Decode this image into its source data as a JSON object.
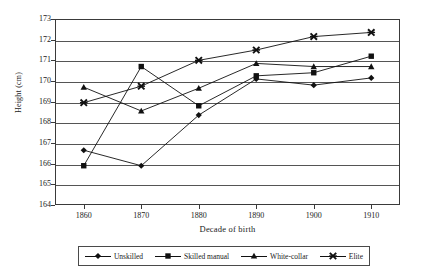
{
  "chart_data": {
    "type": "line",
    "title": "",
    "xlabel": "Decade of birth",
    "ylabel": "Height (cm)",
    "categories": [
      "1860",
      "1870",
      "1880",
      "1890",
      "1900",
      "1910"
    ],
    "x": [
      1860,
      1870,
      1880,
      1890,
      1900,
      1910
    ],
    "ylim": [
      164,
      173
    ],
    "xlim": [
      1855,
      1915
    ],
    "yticks": [
      "164",
      "165",
      "166",
      "167",
      "168",
      "169",
      "170",
      "171",
      "172",
      "173"
    ],
    "grid": true,
    "legend_position": "bottom",
    "series": [
      {
        "name": "Unskilled",
        "marker": "diamond",
        "values": [
          166.65,
          165.9,
          168.35,
          170.1,
          169.8,
          170.15
        ]
      },
      {
        "name": "Skilled manual",
        "marker": "square",
        "values": [
          165.9,
          170.7,
          168.8,
          170.25,
          170.4,
          171.2
        ]
      },
      {
        "name": "White-collar",
        "marker": "triangle",
        "values": [
          169.7,
          168.55,
          169.65,
          170.85,
          170.7,
          170.7
        ]
      },
      {
        "name": "Elite",
        "marker": "cross",
        "values": [
          168.95,
          169.75,
          171.0,
          171.5,
          172.15,
          172.35
        ]
      }
    ]
  },
  "colors": {
    "line": "#111111",
    "axis": "#3a3a3a",
    "grid": "#555555",
    "background": "#ffffff"
  }
}
